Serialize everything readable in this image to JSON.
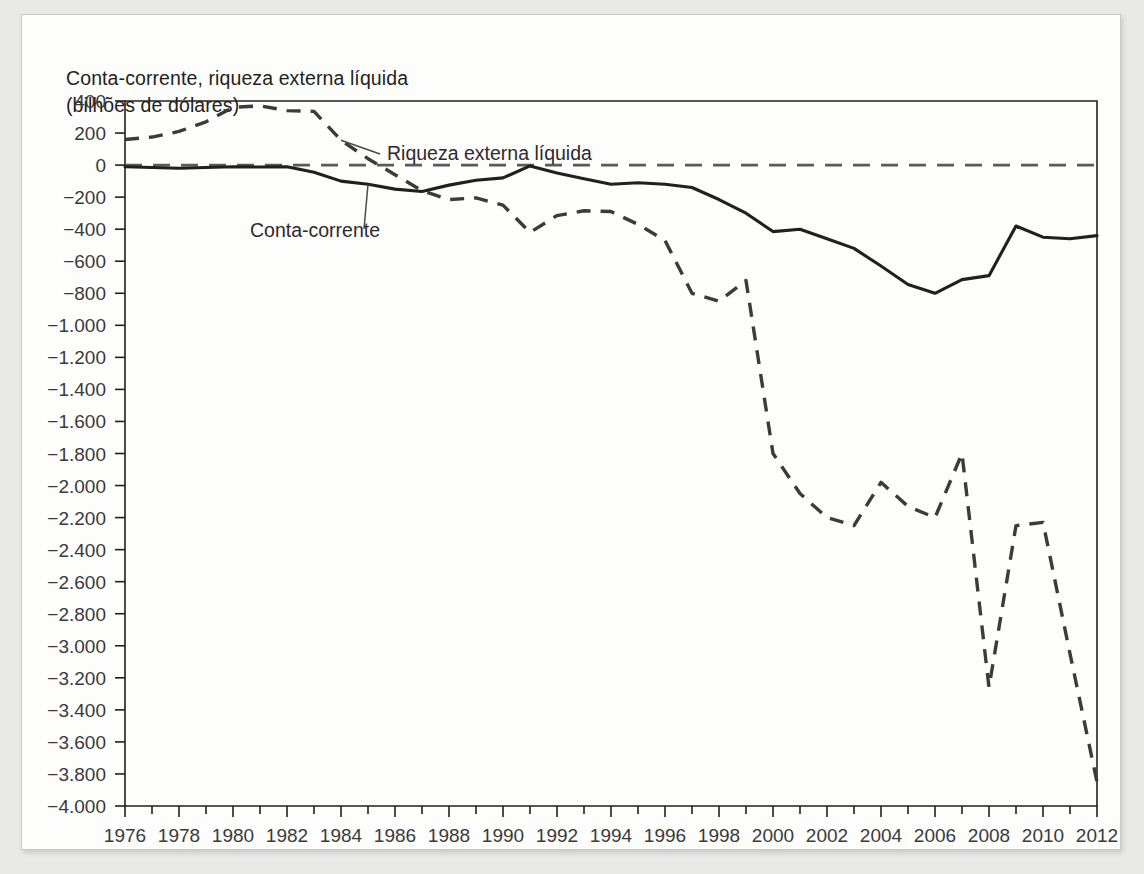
{
  "figure": {
    "title_line1": "Conta-corrente, riqueza externa líquida",
    "title_line2": "(bilhões de dólares)",
    "background_color": "#e9e9e7",
    "card_color": "#fdfdfc",
    "line_color": "#231f20"
  },
  "chart_data": {
    "type": "line",
    "title": "Conta-corrente, riqueza externa líquida (bilhões de dólares)",
    "xlabel": "",
    "ylabel": "Conta-corrente, riqueza externa líquida (bilhões de dólares)",
    "xlim": [
      1976,
      2012
    ],
    "ylim": [
      -4000,
      400
    ],
    "ytick_step": 200,
    "grid": false,
    "legend": "inline-annotations",
    "zero_reference_line": true,
    "ytick_labels": [
      "400",
      "200",
      "0",
      "−200",
      "−400",
      "−600",
      "−800",
      "−1.000",
      "−1.200",
      "−1.400",
      "−1.600",
      "−1.800",
      "−2.000",
      "−2.200",
      "−2.400",
      "−2.600",
      "−2.800",
      "−3.000",
      "−3.200",
      "−3.400",
      "−3.600",
      "−3.800",
      "−4.000"
    ],
    "ytick_values": [
      400,
      200,
      0,
      -200,
      -400,
      -600,
      -800,
      -1000,
      -1200,
      -1400,
      -1600,
      -1800,
      -2000,
      -2200,
      -2400,
      -2600,
      -2800,
      -3000,
      -3200,
      -3400,
      -3600,
      -3800,
      -4000
    ],
    "xtick_labels": [
      "1976",
      "1978",
      "1980",
      "1982",
      "1984",
      "1986",
      "1988",
      "1990",
      "1992",
      "1994",
      "1996",
      "1998",
      "2000",
      "2002",
      "2004",
      "2006",
      "2008",
      "2010",
      "2012"
    ],
    "xtick_values": [
      1976,
      1978,
      1980,
      1982,
      1984,
      1986,
      1988,
      1990,
      1992,
      1994,
      1996,
      1998,
      2000,
      2002,
      2004,
      2006,
      2008,
      2010,
      2012
    ],
    "x": [
      1976,
      1977,
      1978,
      1979,
      1980,
      1981,
      1982,
      1983,
      1984,
      1985,
      1986,
      1987,
      1988,
      1989,
      1990,
      1991,
      1992,
      1993,
      1994,
      1995,
      1996,
      1997,
      1998,
      1999,
      2000,
      2001,
      2002,
      2003,
      2004,
      2005,
      2006,
      2007,
      2008,
      2009,
      2010,
      2011,
      2012
    ],
    "series": [
      {
        "name": "Riqueza externa líquida",
        "style": "dashed",
        "label": "Riqueza externa líquida",
        "values": [
          160,
          175,
          210,
          270,
          360,
          370,
          340,
          335,
          155,
          40,
          -60,
          -160,
          -215,
          -205,
          -250,
          -420,
          -315,
          -285,
          -290,
          -370,
          -470,
          -800,
          -850,
          -720,
          -1800,
          -2050,
          -2200,
          -2250,
          -1980,
          -2130,
          -2200,
          -1800,
          -3260,
          -2250,
          -2230,
          -3050,
          -3850
        ]
      },
      {
        "name": "Conta-corrente",
        "style": "solid",
        "label": "Conta-corrente",
        "values": [
          -10,
          -15,
          -20,
          -15,
          -10,
          -12,
          -10,
          -45,
          -100,
          -120,
          -150,
          -165,
          -125,
          -95,
          -80,
          -5,
          -50,
          -85,
          -120,
          -110,
          -120,
          -140,
          -215,
          -300,
          -415,
          -400,
          -460,
          -520,
          -630,
          -745,
          -800,
          -715,
          -690,
          -380,
          -450,
          -460,
          -440
        ]
      }
    ],
    "annotations": [
      {
        "text": "Riqueza externa líquida",
        "points_to_series": "Riqueza externa líquida",
        "points_to_year": 1984
      },
      {
        "text": "Conta-corrente",
        "points_to_series": "Conta-corrente",
        "points_to_year": 1985
      }
    ]
  }
}
